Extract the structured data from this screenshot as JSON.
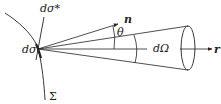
{
  "diagram": {
    "labels": {
      "dsigma_star": "dσ*",
      "dsigma": "dσ",
      "sigma_surface": "Σ",
      "normal": "n",
      "theta": "θ",
      "solid_angle": "dΩ",
      "direction": "r"
    },
    "colors": {
      "stroke": "#222222",
      "background": "#ffffff"
    }
  }
}
